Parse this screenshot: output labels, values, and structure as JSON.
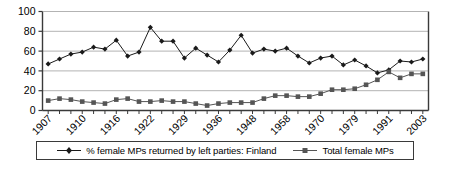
{
  "chart_data": {
    "type": "line",
    "title": "",
    "subtitle": "",
    "xlabel": "",
    "ylabel": "",
    "ylim": [
      0,
      100
    ],
    "yticks": [
      0,
      20,
      40,
      60,
      80,
      100
    ],
    "grid": true,
    "legend_position": "bottom",
    "x": [
      1907,
      1908,
      1909,
      1910,
      1911,
      1913,
      1916,
      1917,
      1919,
      1922,
      1924,
      1927,
      1929,
      1930,
      1933,
      1936,
      1939,
      1945,
      1948,
      1951,
      1954,
      1958,
      1962,
      1966,
      1970,
      1972,
      1975,
      1979,
      1983,
      1987,
      1991,
      1995,
      1999,
      2003
    ],
    "xticklabels": [
      "1907",
      "1910",
      "1916",
      "1922",
      "1929",
      "1936",
      "1948",
      "1958",
      "1970",
      "1979",
      "1991",
      "2003"
    ],
    "xticklabel_positions": [
      1907,
      1910,
      1916,
      1922,
      1929,
      1936,
      1948,
      1958,
      1970,
      1979,
      1991,
      2003
    ],
    "series": [
      {
        "name": "% female MPs returned by left parties: Finland",
        "marker": "diamond",
        "color": "#1a1a1a",
        "values": [
          47,
          52,
          57,
          59,
          64,
          62,
          71,
          55,
          59,
          84,
          70,
          70,
          53,
          63,
          56,
          49,
          61,
          76,
          58,
          62,
          60,
          63,
          55,
          48,
          53,
          55,
          46,
          51,
          45,
          38,
          41,
          50,
          49,
          52
        ]
      },
      {
        "name": "Total female MPs",
        "marker": "square",
        "color": "#555555",
        "values": [
          10,
          12,
          11,
          9,
          8,
          7,
          11,
          12,
          9,
          9,
          10,
          9,
          9,
          7,
          5,
          7,
          8,
          8,
          8,
          12,
          15,
          15,
          14,
          14,
          17,
          21,
          21,
          22,
          26,
          31,
          39,
          33,
          37,
          37
        ]
      }
    ]
  },
  "legend": {
    "entries": [
      {
        "label": "% female MPs returned by left parties: Finland",
        "marker": "diamond"
      },
      {
        "label": "Total female MPs",
        "marker": "square"
      }
    ]
  },
  "axes": {
    "y_tick_labels": [
      "100",
      "80",
      "60",
      "40",
      "20",
      "0"
    ],
    "x_tick_labels": [
      "1907",
      "1910",
      "1916",
      "1922",
      "1929",
      "1936",
      "1948",
      "1958",
      "1970",
      "1979",
      "1991",
      "2003"
    ]
  },
  "colors": {
    "series_1": "#1a1a1a",
    "series_2": "#555555",
    "grid": "#b3b3b3",
    "axis": "#3a3a3a",
    "background": "#ffffff"
  }
}
